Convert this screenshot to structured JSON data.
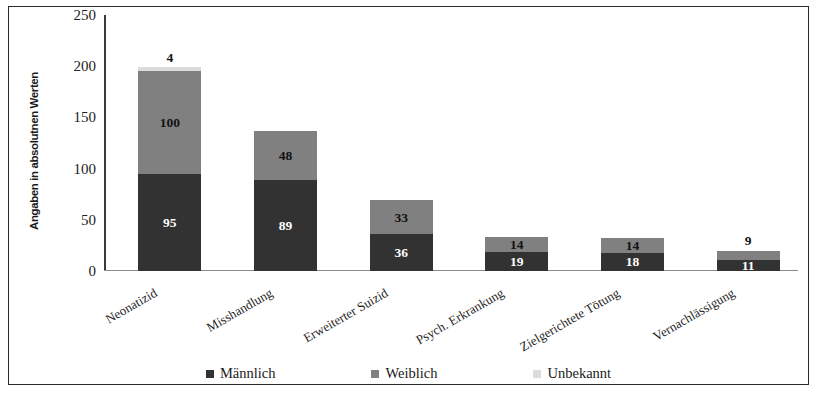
{
  "chart_data": {
    "type": "bar",
    "subtype": "stacked-bar",
    "title": "",
    "xlabel": "",
    "ylabel": "Angaben in absolutnen Werten",
    "ylim": [
      0,
      250
    ],
    "yticks": [
      0,
      50,
      100,
      150,
      200,
      250
    ],
    "grid": false,
    "legend_position": "bottom",
    "categories": [
      "Neonatizid",
      "Misshandlung",
      "Erweiterter Suizid",
      "Psych. Erkrankung",
      "Zielgerichtete Tötung",
      "Vernachlässigung"
    ],
    "series": [
      {
        "name": "Männlich",
        "color": "#323232",
        "label_color": "#ffffff",
        "values": [
          95,
          89,
          36,
          19,
          18,
          11
        ]
      },
      {
        "name": "Weiblich",
        "color": "#808080",
        "label_color": "#111111",
        "values": [
          100,
          48,
          33,
          14,
          14,
          9
        ]
      },
      {
        "name": "Unbekannt",
        "color": "#dcdcdc",
        "label_color": "#111111",
        "values": [
          4,
          0,
          0,
          0,
          0,
          0
        ]
      }
    ],
    "totals": [
      199,
      137,
      69,
      33,
      32,
      20
    ],
    "value_labels_outside": {
      "Neonatizid": {
        "Unbekannt": "4"
      }
    }
  },
  "legend": {
    "items": [
      {
        "label": "Männlich",
        "swatch": "maennlich"
      },
      {
        "label": "Weiblich",
        "swatch": "weiblich"
      },
      {
        "label": "Unbekannt",
        "swatch": "unbekannt"
      }
    ]
  },
  "axis": {
    "y_title": "Angaben in absolutnen Werten",
    "y_ticks": [
      "250",
      "200",
      "150",
      "100",
      "50",
      "0"
    ]
  }
}
